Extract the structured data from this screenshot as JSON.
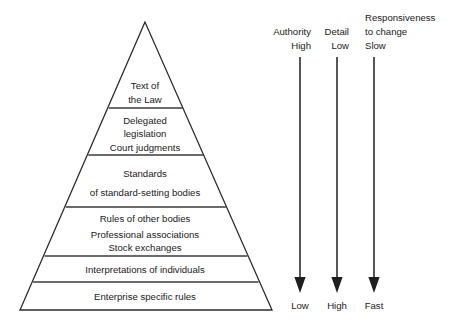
{
  "diagram": {
    "background_color": "#ffffff",
    "line_color": "#2b2b2b",
    "text_color": "#1a1a1a",
    "pyramid": {
      "apex": {
        "x": 145,
        "y": 22
      },
      "base_left": {
        "x": 20,
        "y": 310
      },
      "base_right": {
        "x": 272,
        "y": 310
      },
      "bands": [
        {
          "id": "band-1",
          "divider_y": 108,
          "lines": [
            "Text of",
            "the Law"
          ]
        },
        {
          "id": "band-2",
          "divider_y": 155,
          "lines": [
            "Delegated",
            "legislation",
            "Court judgments"
          ]
        },
        {
          "id": "band-3",
          "divider_y": 207,
          "lines": [
            "Standards",
            "of standard-setting bodies"
          ]
        },
        {
          "id": "band-4",
          "divider_y": 256,
          "lines": [
            "Rules of other bodies",
            "Professional associations",
            "Stock exchanges"
          ]
        },
        {
          "id": "band-5",
          "divider_y": 282,
          "lines": [
            "Interpretations of individuals"
          ]
        },
        {
          "id": "band-6",
          "divider_y": 310,
          "lines": [
            "Enterprise specific rules"
          ]
        }
      ]
    },
    "axes": [
      {
        "id": "axis-authority",
        "name": "Authority",
        "name_lines": [
          "Authority"
        ],
        "top_value": "High",
        "bottom_value": "Low",
        "x": 300,
        "top_y": 57,
        "bottom_y": 290,
        "label_align": "end",
        "label_x": 311
      },
      {
        "id": "axis-detail",
        "name": "Detail",
        "name_lines": [
          "Detail"
        ],
        "top_value": "Low",
        "bottom_value": "High",
        "x": 337,
        "top_y": 57,
        "bottom_y": 290,
        "label_align": "end",
        "label_x": 349,
        "bottom_y_extra": 0
      },
      {
        "id": "axis-responsiveness",
        "name": "Responsiveness to change",
        "name_lines": [
          "Responsiveness",
          "to change"
        ],
        "top_value": "Slow",
        "bottom_value": "Fast",
        "x": 374,
        "top_y": 57,
        "bottom_y": 290,
        "label_align": "start",
        "label_x": 365
      }
    ]
  }
}
